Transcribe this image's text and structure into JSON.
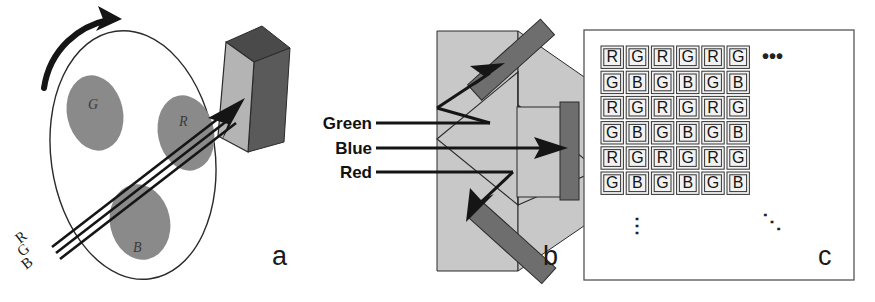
{
  "figure": {
    "width": 875,
    "height": 302,
    "background": "#ffffff"
  },
  "colors": {
    "ink": "#111111",
    "light_gray": "#c8c8c8",
    "mid_gray": "#8a8a8a",
    "dark_gray": "#6e6e6e",
    "plate_face": "#b4b4b4",
    "plate_edge": "#4a4a4a",
    "cell_fill": "#f2f2f2",
    "cell_border": "#333333"
  },
  "panels": [
    {
      "id": "a",
      "label": "a",
      "name": "rotating-color-filter-wheel",
      "wheel_filters": [
        {
          "label": "G",
          "name": "green-filter-segment"
        },
        {
          "label": "R",
          "name": "red-filter-segment"
        },
        {
          "label": "B",
          "name": "blue-filter-segment"
        }
      ],
      "beam_labels": [
        {
          "label": "R",
          "name": "beam-label-r"
        },
        {
          "label": "G",
          "name": "beam-label-g"
        },
        {
          "label": "B",
          "name": "beam-label-b"
        }
      ]
    },
    {
      "id": "b",
      "label": "b",
      "name": "dichroic-prism-beam-splitter",
      "beam_labels": [
        {
          "label": "Green",
          "name": "green-beam-label"
        },
        {
          "label": "Blue",
          "name": "blue-beam-label"
        },
        {
          "label": "Red",
          "name": "red-beam-label"
        }
      ]
    },
    {
      "id": "c",
      "label": "c",
      "name": "bayer-color-filter-array",
      "ellipsis": {
        "horizontal": "•••",
        "vertical": "⋮",
        "diagonal": "⋱"
      }
    }
  ],
  "bayer_grid": {
    "rows": 6,
    "columns": 6,
    "cells": [
      [
        "R",
        "G",
        "R",
        "G",
        "R",
        "G"
      ],
      [
        "G",
        "B",
        "G",
        "B",
        "G",
        "B"
      ],
      [
        "R",
        "G",
        "R",
        "G",
        "R",
        "G"
      ],
      [
        "G",
        "B",
        "G",
        "B",
        "G",
        "B"
      ],
      [
        "R",
        "G",
        "R",
        "G",
        "R",
        "G"
      ],
      [
        "G",
        "B",
        "G",
        "B",
        "G",
        "B"
      ]
    ]
  }
}
